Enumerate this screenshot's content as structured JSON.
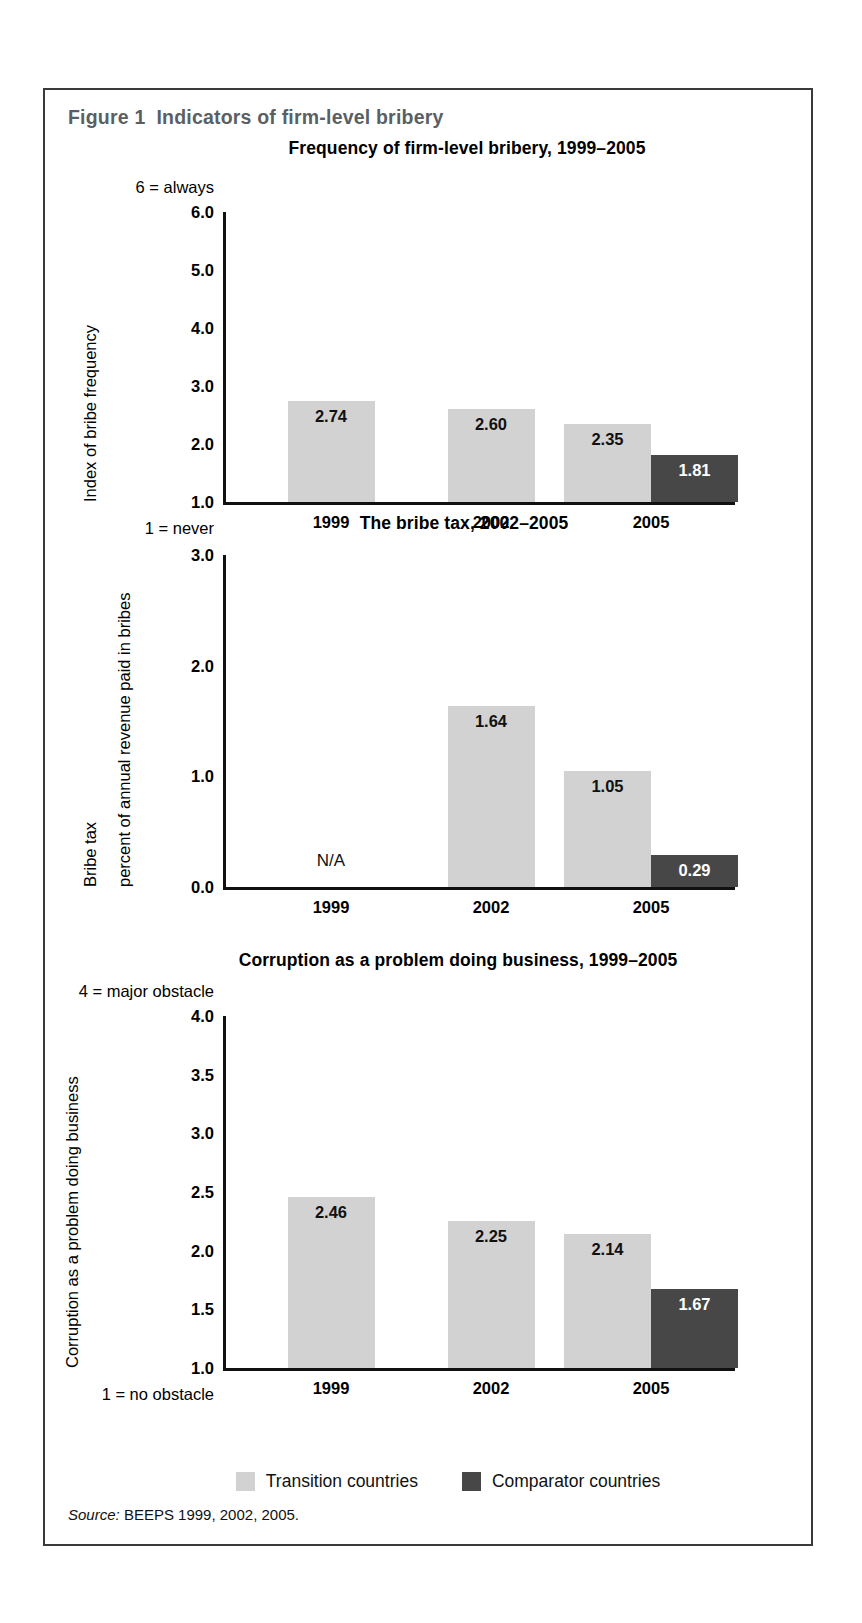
{
  "figure": {
    "number_label": "Figure 1",
    "caption": "Indicators of firm-level bribery"
  },
  "legend": {
    "items": [
      {
        "label": "Transition countries",
        "color": "#d2d2d2",
        "key": "transition"
      },
      {
        "label": "Comparator countries",
        "color": "#474747",
        "key": "comparator"
      }
    ]
  },
  "source": {
    "keyword": "Source:",
    "text": "BEEPS 1999, 2002, 2005."
  },
  "chart_data": [
    {
      "type": "bar",
      "title": "Frequency of firm-level bribery, 1999–2005",
      "xlabel": "",
      "ylabel": "Index of bribe frequency",
      "ylim": [
        1.0,
        6.0
      ],
      "yticks": [
        "1.0",
        "2.0",
        "3.0",
        "4.0",
        "5.0",
        "6.0"
      ],
      "ytick_values": [
        1.0,
        2.0,
        3.0,
        4.0,
        5.0,
        6.0
      ],
      "y_top_caption": "6 = always",
      "y_bottom_caption": "1 = never",
      "grid": false,
      "legend_position": "bottom",
      "categories": [
        "1999",
        "2002",
        "2005"
      ],
      "series": [
        {
          "name": "Transition countries",
          "color": "#d2d2d2",
          "values": [
            2.74,
            2.6,
            2.35
          ],
          "labels": [
            "2.74",
            "2.60",
            "2.35"
          ]
        },
        {
          "name": "Comparator countries",
          "color": "#474747",
          "values": [
            null,
            null,
            1.81
          ],
          "labels": [
            "",
            "",
            "1.81"
          ]
        }
      ]
    },
    {
      "type": "bar",
      "title": "The bribe tax, 2002–2005",
      "xlabel": "",
      "ylabel": "Bribe tax",
      "ylabel2": "percent of annual revenue paid in bribes",
      "ylim": [
        0.0,
        3.0
      ],
      "yticks": [
        "0.0",
        "1.0",
        "2.0",
        "3.0"
      ],
      "ytick_values": [
        0.0,
        1.0,
        2.0,
        3.0
      ],
      "grid": false,
      "legend_position": "bottom",
      "categories": [
        "1999",
        "2002",
        "2005"
      ],
      "missing_label": "N/A",
      "missing_category": "1999",
      "series": [
        {
          "name": "Transition countries",
          "color": "#d2d2d2",
          "values": [
            null,
            1.64,
            1.05
          ],
          "labels": [
            "",
            "1.64",
            "1.05"
          ]
        },
        {
          "name": "Comparator countries",
          "color": "#474747",
          "values": [
            null,
            null,
            0.29
          ],
          "labels": [
            "",
            "",
            "0.29"
          ]
        }
      ]
    },
    {
      "type": "bar",
      "title": "Corruption as a problem doing business, 1999–2005",
      "xlabel": "",
      "ylabel": "Corruption as a problem doing business",
      "ylim": [
        1.0,
        4.0
      ],
      "yticks": [
        "1.0",
        "1.5",
        "2.0",
        "2.5",
        "3.0",
        "3.5",
        "4.0"
      ],
      "ytick_values": [
        1.0,
        1.5,
        2.0,
        2.5,
        3.0,
        3.5,
        4.0
      ],
      "y_top_caption": "4 = major obstacle",
      "y_bottom_caption": "1 = no obstacle",
      "grid": false,
      "legend_position": "bottom",
      "categories": [
        "1999",
        "2002",
        "2005"
      ],
      "series": [
        {
          "name": "Transition countries",
          "color": "#d2d2d2",
          "values": [
            2.46,
            2.25,
            2.14
          ],
          "labels": [
            "2.46",
            "2.25",
            "2.14"
          ]
        },
        {
          "name": "Comparator countries",
          "color": "#474747",
          "values": [
            null,
            null,
            1.67
          ],
          "labels": [
            "",
            "",
            "1.67"
          ]
        }
      ]
    }
  ]
}
